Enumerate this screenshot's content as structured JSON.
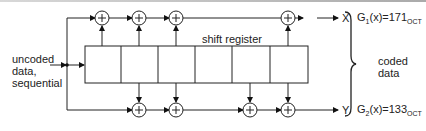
{
  "diagram": {
    "input_label": [
      "uncoded",
      "data,",
      "sequential"
    ],
    "register_label": "shift register",
    "register_cells": 6,
    "outputs": {
      "x_label": "X",
      "y_label": "Y"
    },
    "coded_label": [
      "coded",
      "data"
    ],
    "generators": {
      "g1": {
        "prefix": "G",
        "index": "1",
        "expr": "(x)=171",
        "base": "OCT"
      },
      "g2": {
        "prefix": "G",
        "index": "2",
        "expr": "(x)=133",
        "base": "OCT"
      }
    },
    "adder_symbol": "+",
    "top_adders_count": 4,
    "bottom_adders_count": 4
  }
}
